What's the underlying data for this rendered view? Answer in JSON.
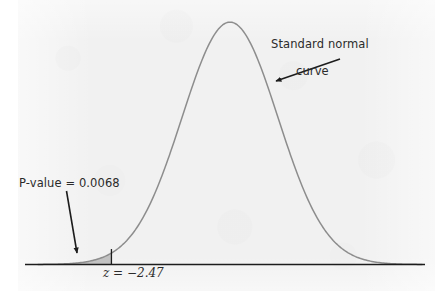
{
  "figure": {
    "background_color": "#ffffff",
    "panel_color": "#f1f1f1",
    "curve_color": "#8d8d8d",
    "axis_color": "#1c1c1c",
    "annotation_color": "#2b2b2b",
    "shade_color": "#9a9a9a"
  },
  "annotations": {
    "curve_label_line1": "Standard normal",
    "curve_label_line2": "curve",
    "pvalue_label": "P-value = 0.0068",
    "z_label": "z = −2.47"
  },
  "chart_data": {
    "type": "line",
    "title": "",
    "subtitle": "",
    "xlabel": "",
    "ylabel": "",
    "grid": false,
    "legend": "none",
    "distribution": "standard normal",
    "mean": 0,
    "sd": 1,
    "xlim": [
      -4.0,
      4.0
    ],
    "ylim": [
      0,
      0.4
    ],
    "axis_visible": true,
    "x": [
      -4.0,
      -3.8,
      -3.6,
      -3.4,
      -3.2,
      -3.0,
      -2.8,
      -2.6,
      -2.47,
      -2.4,
      -2.2,
      -2.0,
      -1.8,
      -1.6,
      -1.4,
      -1.2,
      -1.0,
      -0.8,
      -0.6,
      -0.4,
      -0.2,
      0.0,
      0.2,
      0.4,
      0.6,
      0.8,
      1.0,
      1.2,
      1.4,
      1.6,
      1.8,
      2.0,
      2.2,
      2.4,
      2.6,
      2.8,
      3.0,
      3.2,
      3.4,
      3.6,
      3.8,
      4.0
    ],
    "y": [
      0.0001,
      0.0003,
      0.0006,
      0.0012,
      0.0024,
      0.0044,
      0.0079,
      0.0136,
      0.0189,
      0.0224,
      0.0355,
      0.054,
      0.079,
      0.1109,
      0.1497,
      0.1942,
      0.242,
      0.2897,
      0.3332,
      0.3683,
      0.391,
      0.3989,
      0.391,
      0.3683,
      0.3332,
      0.2897,
      0.242,
      0.1942,
      0.1497,
      0.1109,
      0.079,
      0.054,
      0.0355,
      0.0224,
      0.0136,
      0.0079,
      0.0044,
      0.0024,
      0.0012,
      0.0006,
      0.0003,
      0.0001
    ],
    "markers": [
      {
        "name": "critical-value",
        "z": -2.47,
        "label": "z = −2.47",
        "tail": "left",
        "tail_area": 0.0068,
        "shaded": true
      }
    ],
    "callouts": [
      {
        "name": "curve-callout",
        "text": "Standard normal curve",
        "target_z": 0.22,
        "arrow": true
      },
      {
        "name": "pvalue-callout",
        "text": "P-value = 0.0068",
        "target_z": -2.47,
        "arrow": true
      }
    ]
  }
}
